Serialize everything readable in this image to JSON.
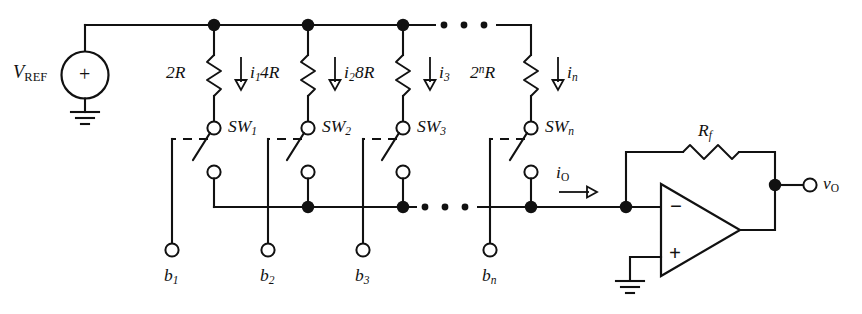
{
  "figure": {
    "background_color": "#ffffff",
    "line_color": "#111111"
  },
  "source": {
    "name": "voltage-reference-source",
    "label_main": "V",
    "label_sub": "REF",
    "polarity": "+",
    "ground": "ground-symbol"
  },
  "ladder": {
    "branches": [
      {
        "resistor": "2R",
        "resistor_base": "2",
        "resistor_exp": "",
        "current_sym": "i",
        "current_sub": "1",
        "switch": "SW",
        "switch_sub": "1",
        "bit": "b",
        "bit_sub": "1"
      },
      {
        "resistor": "4R",
        "resistor_base": "4",
        "resistor_exp": "",
        "current_sym": "i",
        "current_sub": "2",
        "switch": "SW",
        "switch_sub": "2",
        "bit": "b",
        "bit_sub": "2"
      },
      {
        "resistor": "8R",
        "resistor_base": "8",
        "resistor_exp": "",
        "current_sym": "i",
        "current_sub": "3",
        "switch": "SW",
        "switch_sub": "3",
        "bit": "b",
        "bit_sub": "3"
      },
      {
        "resistor": "2^nR",
        "resistor_base": "2",
        "resistor_exp": "n",
        "current_sym": "i",
        "current_sub": "n",
        "switch": "SW",
        "switch_sub": "n",
        "bit": "b",
        "bit_sub": "n"
      }
    ],
    "ellipsis": "• • •"
  },
  "output_stage": {
    "feedback_resistor": "R",
    "feedback_resistor_sub": "f",
    "output_current": "i",
    "output_current_sub": "O",
    "output_voltage": "v",
    "output_voltage_sub": "O",
    "inverting_input_sign": "−",
    "noninverting_input_sign": "+",
    "ground": "ground-symbol"
  }
}
